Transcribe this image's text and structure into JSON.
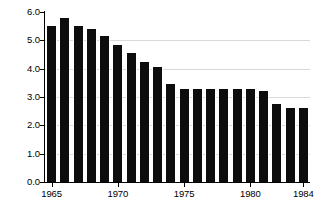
{
  "chart_data": {
    "type": "bar",
    "title": "",
    "subtitle": "",
    "xlabel": "",
    "ylabel": "",
    "categories": [
      "1965",
      "1966",
      "1967",
      "1968",
      "1969",
      "1970",
      "1971",
      "1972",
      "1973",
      "1974",
      "1975",
      "1976",
      "1977",
      "1978",
      "1979",
      "1980",
      "1981",
      "1982",
      "1983",
      "1984"
    ],
    "values": [
      5.5,
      5.8,
      5.5,
      5.4,
      5.15,
      4.85,
      4.55,
      4.25,
      4.05,
      3.45,
      3.3,
      3.3,
      3.3,
      3.3,
      3.3,
      3.3,
      3.2,
      2.75,
      2.6,
      2.6
    ],
    "ylim": [
      0.0,
      6.0
    ],
    "ytick_values": [
      0.0,
      1.0,
      2.0,
      3.0,
      4.0,
      5.0,
      6.0
    ],
    "ytick_labels": [
      "0.0",
      "1.0",
      "2.0",
      "3.0",
      "4.0",
      "5.0",
      "6.0"
    ],
    "xtick_labels": [
      "1965",
      "1970",
      "1975",
      "1980",
      "1984"
    ],
    "xtick_categories": [
      "1965",
      "1970",
      "1975",
      "1980",
      "1984"
    ],
    "grid": true,
    "grid_axis": "y",
    "legend": false,
    "legend_position": "none",
    "bar_color": "#0d0d0d",
    "background_color": "#ffffff",
    "axis_color": "#000000",
    "grid_color": "#b9b9b9"
  }
}
